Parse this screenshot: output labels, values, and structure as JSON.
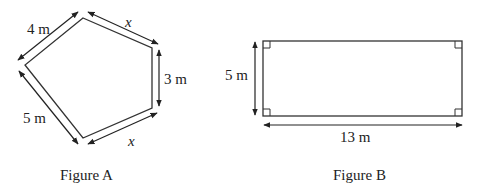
{
  "figure_a": {
    "caption": "Figure A",
    "shape": "pentagon",
    "labels": {
      "top_left_side": "4 m",
      "top_right_side": "x",
      "right_side": "3 m",
      "bottom_right_side": "x",
      "bottom_left_side": "5 m"
    }
  },
  "figure_b": {
    "caption": "Figure B",
    "shape": "rectangle",
    "labels": {
      "height": "5 m",
      "width": "13 m"
    }
  },
  "colors": {
    "stroke": "#333333",
    "text": "#222222",
    "background": "#ffffff"
  }
}
